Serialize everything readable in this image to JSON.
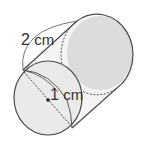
{
  "figure": {
    "type": "cylinder",
    "labels": {
      "slant_length": {
        "value": "2",
        "unit": "cm"
      },
      "radius": {
        "value": "1",
        "unit": "cm"
      }
    },
    "colors": {
      "stroke": "#4a4a4a",
      "side_fill": "#f4f4f4",
      "back_face_fill": "#dcdcdc",
      "front_face_fill": "#eaeaea"
    }
  }
}
